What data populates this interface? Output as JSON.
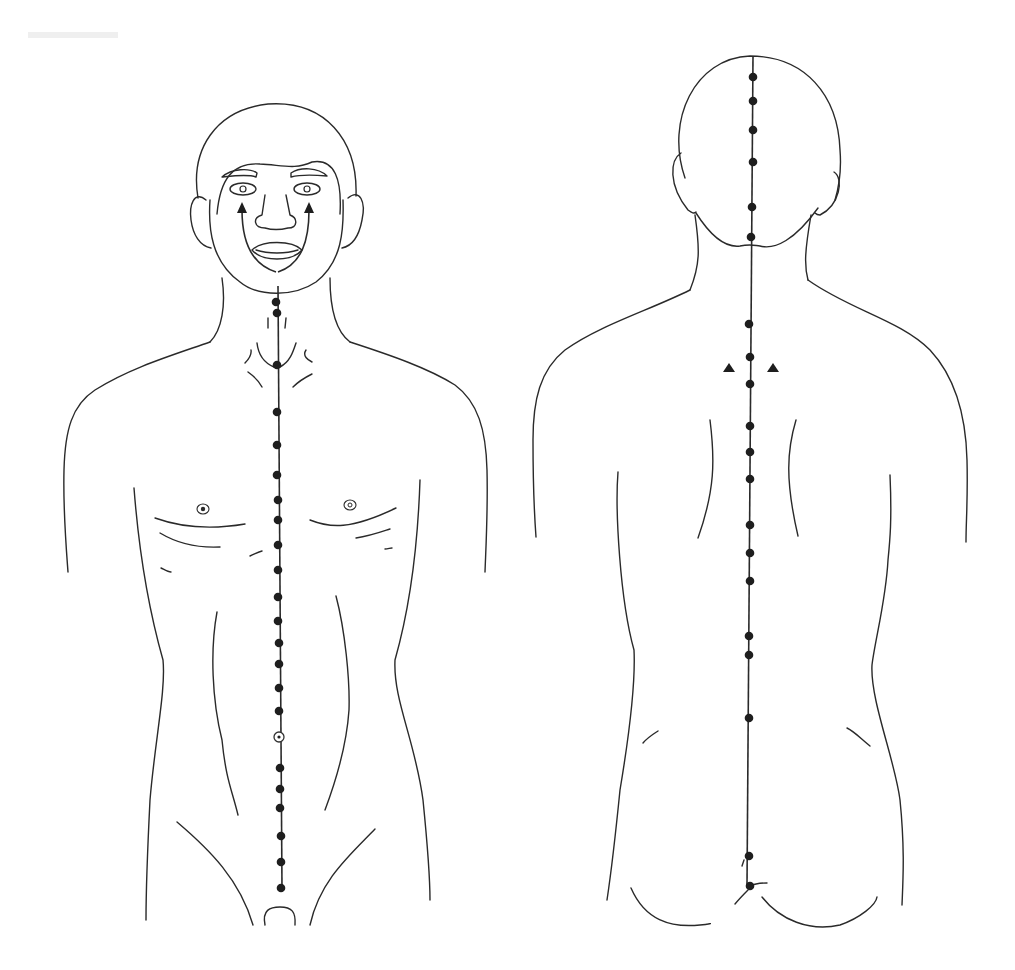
{
  "figure": {
    "type": "anatomical-acupoint-diagram",
    "background": "#ffffff",
    "line_color": "#2a2a2a",
    "point_color": "#1e1e1e",
    "views": [
      {
        "name": "front-view",
        "meridian": "anterior midline",
        "line": {
          "x1": 278,
          "y1": 286,
          "x2": 282,
          "y2": 888
        },
        "points": [
          {
            "x": 276,
            "y": 302
          },
          {
            "x": 277,
            "y": 313
          },
          {
            "x": 277,
            "y": 365
          },
          {
            "x": 277,
            "y": 412
          },
          {
            "x": 277,
            "y": 445
          },
          {
            "x": 277,
            "y": 475
          },
          {
            "x": 278,
            "y": 500
          },
          {
            "x": 278,
            "y": 520
          },
          {
            "x": 278,
            "y": 545
          },
          {
            "x": 278,
            "y": 570
          },
          {
            "x": 278,
            "y": 597
          },
          {
            "x": 278,
            "y": 621
          },
          {
            "x": 279,
            "y": 643
          },
          {
            "x": 279,
            "y": 664
          },
          {
            "x": 279,
            "y": 688
          },
          {
            "x": 279,
            "y": 711
          },
          {
            "x": 280,
            "y": 768
          },
          {
            "x": 280,
            "y": 789
          },
          {
            "x": 280,
            "y": 808
          },
          {
            "x": 281,
            "y": 836
          },
          {
            "x": 281,
            "y": 862
          },
          {
            "x": 281,
            "y": 888
          }
        ],
        "open_points": [
          {
            "x": 279,
            "y": 737
          }
        ],
        "arrows": [
          {
            "from": {
              "x": 266,
              "y": 270
            },
            "to": {
              "x": 242,
              "y": 206
            }
          },
          {
            "from": {
              "x": 286,
              "y": 270
            },
            "to": {
              "x": 308,
              "y": 206
            }
          }
        ]
      },
      {
        "name": "back-view",
        "meridian": "posterior midline",
        "line": {
          "x1": 753,
          "y1": 56,
          "x2": 747,
          "y2": 886
        },
        "points": [
          {
            "x": 753,
            "y": 77
          },
          {
            "x": 753,
            "y": 101
          },
          {
            "x": 753,
            "y": 130
          },
          {
            "x": 753,
            "y": 162
          },
          {
            "x": 752,
            "y": 207
          },
          {
            "x": 751,
            "y": 237
          },
          {
            "x": 749,
            "y": 324
          },
          {
            "x": 750,
            "y": 357
          },
          {
            "x": 750,
            "y": 384
          },
          {
            "x": 750,
            "y": 426
          },
          {
            "x": 750,
            "y": 452
          },
          {
            "x": 750,
            "y": 479
          },
          {
            "x": 750,
            "y": 525
          },
          {
            "x": 750,
            "y": 553
          },
          {
            "x": 750,
            "y": 581
          },
          {
            "x": 749,
            "y": 636
          },
          {
            "x": 749,
            "y": 655
          },
          {
            "x": 749,
            "y": 718
          },
          {
            "x": 749,
            "y": 856
          },
          {
            "x": 750,
            "y": 886
          }
        ],
        "triangles": [
          {
            "x": 729,
            "y": 368
          },
          {
            "x": 773,
            "y": 368
          }
        ]
      }
    ]
  }
}
